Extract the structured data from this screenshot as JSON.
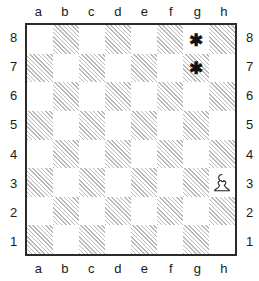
{
  "diagram": {
    "type": "chessboard",
    "files": [
      "a",
      "b",
      "c",
      "d",
      "e",
      "f",
      "g",
      "h"
    ],
    "ranks": [
      "8",
      "7",
      "6",
      "5",
      "4",
      "3",
      "2",
      "1"
    ],
    "colors": {
      "light_square": "#ffffff",
      "dark_square_hatch": "#b9b9b9",
      "border": "#2b2b2b",
      "label_text": "#1a1a1a",
      "marker": "#111111",
      "piece_fill": "#ffffff",
      "piece_outline": "#222222"
    },
    "labels": {
      "top_files": [
        "a",
        "b",
        "c",
        "d",
        "e",
        "f",
        "g",
        "h"
      ],
      "bottom_files": [
        "a",
        "b",
        "c",
        "d",
        "e",
        "f",
        "g",
        "h"
      ],
      "left_ranks": [
        "8",
        "7",
        "6",
        "5",
        "4",
        "3",
        "2",
        "1"
      ],
      "right_ranks": [
        "8",
        "7",
        "6",
        "5",
        "4",
        "3",
        "2",
        "1"
      ]
    },
    "pieces": [
      {
        "square": "h3",
        "piece": "pawn",
        "color": "white",
        "icon": "white-pawn-icon"
      }
    ],
    "markers": [
      {
        "square": "g8",
        "glyph": "✱",
        "icon": "asterisk-marker-icon"
      },
      {
        "square": "g7",
        "glyph": "✱",
        "icon": "asterisk-marker-icon"
      }
    ],
    "squares": [
      {
        "id": "a8",
        "shade": "light",
        "content": ""
      },
      {
        "id": "b8",
        "shade": "dark",
        "content": ""
      },
      {
        "id": "c8",
        "shade": "light",
        "content": ""
      },
      {
        "id": "d8",
        "shade": "dark",
        "content": ""
      },
      {
        "id": "e8",
        "shade": "light",
        "content": ""
      },
      {
        "id": "f8",
        "shade": "dark",
        "content": ""
      },
      {
        "id": "g8",
        "shade": "light",
        "content": "✱"
      },
      {
        "id": "h8",
        "shade": "dark",
        "content": ""
      },
      {
        "id": "a7",
        "shade": "dark",
        "content": ""
      },
      {
        "id": "b7",
        "shade": "light",
        "content": ""
      },
      {
        "id": "c7",
        "shade": "dark",
        "content": ""
      },
      {
        "id": "d7",
        "shade": "light",
        "content": ""
      },
      {
        "id": "e7",
        "shade": "dark",
        "content": ""
      },
      {
        "id": "f7",
        "shade": "light",
        "content": ""
      },
      {
        "id": "g7",
        "shade": "dark",
        "content": "✱"
      },
      {
        "id": "h7",
        "shade": "light",
        "content": ""
      },
      {
        "id": "a6",
        "shade": "light",
        "content": ""
      },
      {
        "id": "b6",
        "shade": "dark",
        "content": ""
      },
      {
        "id": "c6",
        "shade": "light",
        "content": ""
      },
      {
        "id": "d6",
        "shade": "dark",
        "content": ""
      },
      {
        "id": "e6",
        "shade": "light",
        "content": ""
      },
      {
        "id": "f6",
        "shade": "dark",
        "content": ""
      },
      {
        "id": "g6",
        "shade": "light",
        "content": ""
      },
      {
        "id": "h6",
        "shade": "dark",
        "content": ""
      },
      {
        "id": "a5",
        "shade": "dark",
        "content": ""
      },
      {
        "id": "b5",
        "shade": "light",
        "content": ""
      },
      {
        "id": "c5",
        "shade": "dark",
        "content": ""
      },
      {
        "id": "d5",
        "shade": "light",
        "content": ""
      },
      {
        "id": "e5",
        "shade": "dark",
        "content": ""
      },
      {
        "id": "f5",
        "shade": "light",
        "content": ""
      },
      {
        "id": "g5",
        "shade": "dark",
        "content": ""
      },
      {
        "id": "h5",
        "shade": "light",
        "content": ""
      },
      {
        "id": "a4",
        "shade": "light",
        "content": ""
      },
      {
        "id": "b4",
        "shade": "dark",
        "content": ""
      },
      {
        "id": "c4",
        "shade": "light",
        "content": ""
      },
      {
        "id": "d4",
        "shade": "dark",
        "content": ""
      },
      {
        "id": "e4",
        "shade": "light",
        "content": ""
      },
      {
        "id": "f4",
        "shade": "dark",
        "content": ""
      },
      {
        "id": "g4",
        "shade": "light",
        "content": ""
      },
      {
        "id": "h4",
        "shade": "dark",
        "content": ""
      },
      {
        "id": "a3",
        "shade": "dark",
        "content": ""
      },
      {
        "id": "b3",
        "shade": "light",
        "content": ""
      },
      {
        "id": "c3",
        "shade": "dark",
        "content": ""
      },
      {
        "id": "d3",
        "shade": "light",
        "content": ""
      },
      {
        "id": "e3",
        "shade": "dark",
        "content": ""
      },
      {
        "id": "f3",
        "shade": "light",
        "content": ""
      },
      {
        "id": "g3",
        "shade": "dark",
        "content": ""
      },
      {
        "id": "h3",
        "shade": "light",
        "content": "",
        "piece": "white-pawn"
      },
      {
        "id": "a2",
        "shade": "light",
        "content": ""
      },
      {
        "id": "b2",
        "shade": "dark",
        "content": ""
      },
      {
        "id": "c2",
        "shade": "light",
        "content": ""
      },
      {
        "id": "d2",
        "shade": "dark",
        "content": ""
      },
      {
        "id": "e2",
        "shade": "light",
        "content": ""
      },
      {
        "id": "f2",
        "shade": "dark",
        "content": ""
      },
      {
        "id": "g2",
        "shade": "light",
        "content": ""
      },
      {
        "id": "h2",
        "shade": "dark",
        "content": ""
      },
      {
        "id": "a1",
        "shade": "dark",
        "content": ""
      },
      {
        "id": "b1",
        "shade": "light",
        "content": ""
      },
      {
        "id": "c1",
        "shade": "dark",
        "content": ""
      },
      {
        "id": "d1",
        "shade": "light",
        "content": ""
      },
      {
        "id": "e1",
        "shade": "dark",
        "content": ""
      },
      {
        "id": "f1",
        "shade": "light",
        "content": ""
      },
      {
        "id": "g1",
        "shade": "dark",
        "content": ""
      },
      {
        "id": "h1",
        "shade": "light",
        "content": ""
      }
    ]
  }
}
